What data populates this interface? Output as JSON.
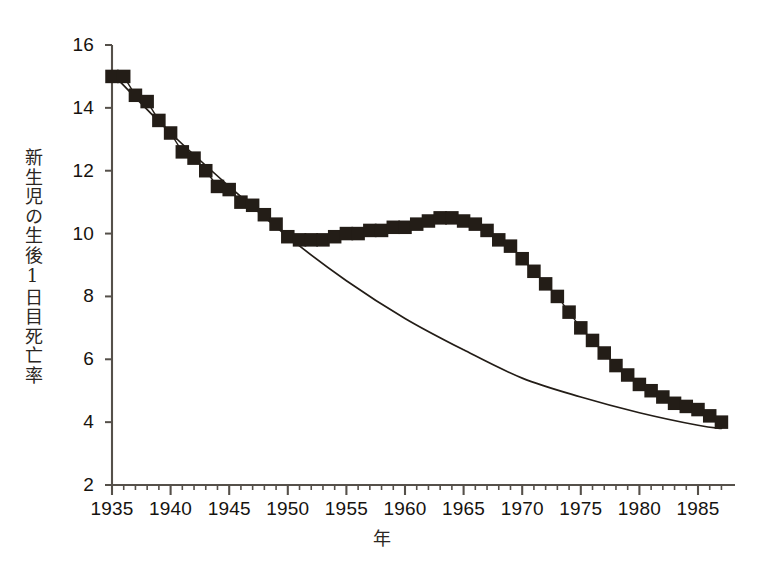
{
  "chart_data": {
    "type": "line",
    "title": "",
    "subtitle": "",
    "xlabel": "年",
    "ylabel": "新生児の生後1日目死亡率",
    "xlim": [
      1934,
      1988
    ],
    "ylim": [
      2,
      16
    ],
    "grid": false,
    "legend": false,
    "x_major_ticks": [
      1935,
      1940,
      1945,
      1950,
      1955,
      1960,
      1965,
      1970,
      1975,
      1980,
      1985
    ],
    "x_tick_labels": [
      "1935",
      "1940",
      "1945",
      "1950",
      "1955",
      "1960",
      "1965",
      "1970",
      "1975",
      "1980",
      "1985"
    ],
    "x_minor_tick_step": 1,
    "y_major_ticks": [
      2,
      4,
      6,
      8,
      10,
      12,
      14,
      16
    ],
    "y_tick_labels": [
      "2",
      "4",
      "6",
      "8",
      "10",
      "12",
      "14",
      "16"
    ],
    "marker": "square",
    "marker_color": "#231d17",
    "line_color": "#231d17",
    "trend_color": "#231d17",
    "series": [
      {
        "name": "observed",
        "style": "markers-with-line",
        "x": [
          1935,
          1936,
          1937,
          1938,
          1939,
          1940,
          1941,
          1942,
          1943,
          1944,
          1945,
          1946,
          1947,
          1948,
          1949,
          1950,
          1951,
          1952,
          1953,
          1954,
          1955,
          1956,
          1957,
          1958,
          1959,
          1960,
          1961,
          1962,
          1963,
          1964,
          1965,
          1966,
          1967,
          1968,
          1969,
          1970,
          1971,
          1972,
          1973,
          1974,
          1975,
          1976,
          1977,
          1978,
          1979,
          1980,
          1981,
          1982,
          1983,
          1984,
          1985,
          1986,
          1987
        ],
        "values": [
          15.0,
          15.0,
          14.4,
          14.2,
          13.6,
          13.2,
          12.6,
          12.4,
          12.0,
          11.5,
          11.4,
          11.0,
          10.9,
          10.6,
          10.3,
          9.9,
          9.8,
          9.8,
          9.8,
          9.9,
          10.0,
          10.0,
          10.1,
          10.1,
          10.2,
          10.2,
          10.3,
          10.4,
          10.5,
          10.5,
          10.4,
          10.3,
          10.1,
          9.8,
          9.6,
          9.2,
          8.8,
          8.4,
          8.0,
          7.5,
          7.0,
          6.6,
          6.2,
          5.8,
          5.5,
          5.2,
          5.0,
          4.8,
          4.6,
          4.5,
          4.4,
          4.2,
          4.0
        ]
      },
      {
        "name": "fitted exponential trend",
        "style": "smooth-line",
        "x": [
          1935,
          1940,
          1945,
          1950,
          1955,
          1960,
          1965,
          1970,
          1975,
          1980,
          1985,
          1987
        ],
        "values": [
          15.1,
          13.2,
          11.5,
          9.9,
          8.5,
          7.3,
          6.3,
          5.4,
          4.8,
          4.3,
          3.9,
          3.8
        ]
      }
    ],
    "annotations": []
  },
  "axes": {
    "y_label_text": "新生児の生後1日目死亡率",
    "x_label_text": "年"
  }
}
